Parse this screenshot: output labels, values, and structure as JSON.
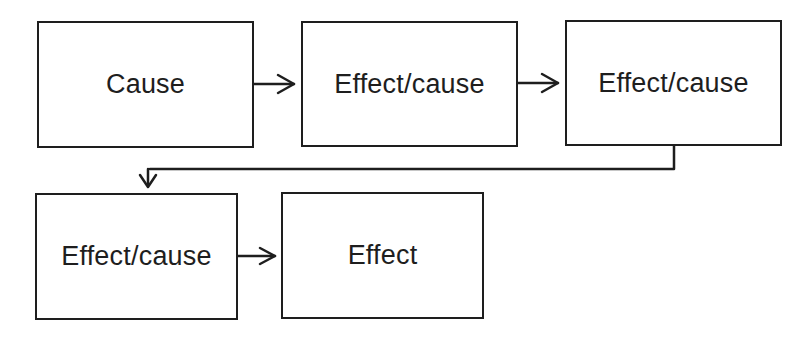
{
  "diagram": {
    "type": "causal-chain",
    "nodes": [
      {
        "id": "n1",
        "label": "Cause"
      },
      {
        "id": "n2",
        "label": "Effect/cause"
      },
      {
        "id": "n3",
        "label": "Effect/cause"
      },
      {
        "id": "n4",
        "label": "Effect/cause"
      },
      {
        "id": "n5",
        "label": "Effect"
      }
    ],
    "edges": [
      {
        "from": "n1",
        "to": "n2"
      },
      {
        "from": "n2",
        "to": "n3"
      },
      {
        "from": "n3",
        "to": "n4"
      },
      {
        "from": "n4",
        "to": "n5"
      }
    ],
    "colors": {
      "stroke": "#1e1e1e",
      "background": "#ffffff"
    }
  }
}
